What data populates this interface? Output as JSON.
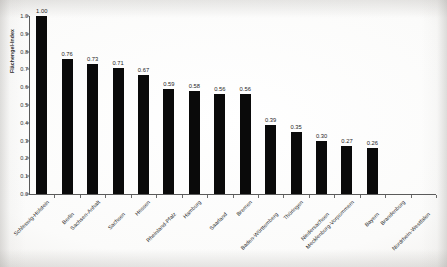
{
  "chart_data": {
    "type": "bar",
    "title": "",
    "xlabel": "",
    "ylabel": "Flächengel-Index",
    "ylim": [
      0.0,
      1.0
    ],
    "ytick_labels": [
      "0.0",
      "0.1",
      "0.2",
      "0.3",
      "0.4",
      "0.5",
      "0.6",
      "0.7",
      "0.8",
      "0.9",
      "1.0"
    ],
    "ytick_values": [
      0.0,
      0.1,
      0.2,
      0.3,
      0.4,
      0.5,
      0.6,
      0.7,
      0.8,
      0.9,
      1.0
    ],
    "grid": false,
    "legend": false,
    "bar_color": "#0a0a0a",
    "categories": [
      "Schleswig-Holstein",
      "Berlin",
      "Sachsen-Anhalt",
      "Sachsen",
      "Hessen",
      "Rheinland-Pfalz",
      "Hamburg",
      "Saarland",
      "Bremen",
      "Baden-Württemberg",
      "Thüringen",
      "Niedersachsen",
      "Mecklenburg-Vorpommern",
      "Bayern",
      "Brandenburg",
      "Nordrhein-Westfalen"
    ],
    "values": [
      1.0,
      0.76,
      0.73,
      0.71,
      0.67,
      0.59,
      0.58,
      0.56,
      0.56,
      0.39,
      0.35,
      0.3,
      0.27,
      0.26,
      null,
      null
    ],
    "value_labels": [
      "1.00",
      "0.76",
      "0.73",
      "0.71",
      "0.67",
      "0.59",
      "0.58",
      "0.56",
      "0.56",
      "0.39",
      "0.35",
      "0.30",
      "0.27",
      "0.26",
      "",
      ""
    ]
  }
}
